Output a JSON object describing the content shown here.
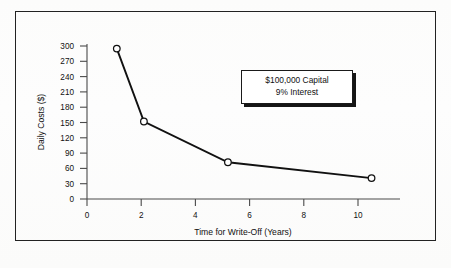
{
  "figure": {
    "background_color": "#fdfdfd",
    "frame_color": "#222222"
  },
  "annotation": {
    "line1": "$100,000 Capital",
    "line2": "9% Interest"
  },
  "chart_data": {
    "type": "line",
    "title": "",
    "subtitle": "",
    "xlabel": "Time for Write-Off (Years)",
    "ylabel": "Daily Costs ($)",
    "xlim": [
      0,
      11
    ],
    "ylim": [
      0,
      300
    ],
    "grid": false,
    "legend": null,
    "marker": "open-circle",
    "line_color": "#111111",
    "marker_face_color": "#ffffff",
    "x": [
      1.1,
      2.1,
      5.2,
      10.5
    ],
    "values": [
      295,
      152,
      72,
      41
    ],
    "points": [
      {
        "x": 1.1,
        "y": 295
      },
      {
        "x": 2.1,
        "y": 152
      },
      {
        "x": 5.2,
        "y": 72
      },
      {
        "x": 10.5,
        "y": 41
      }
    ],
    "xticks": [
      0,
      2,
      4,
      6,
      8,
      10
    ],
    "xtick_labels": [
      "0",
      "2",
      "4",
      "6",
      "8",
      "10"
    ],
    "yticks": [
      0,
      30,
      60,
      90,
      120,
      150,
      180,
      210,
      240,
      270,
      300
    ],
    "ytick_labels": [
      "0",
      "30",
      "60",
      "90",
      "120",
      "150",
      "180",
      "210",
      "240",
      "270",
      "300"
    ],
    "annotations": [
      "$100,000 Capital",
      "9% Interest"
    ]
  }
}
